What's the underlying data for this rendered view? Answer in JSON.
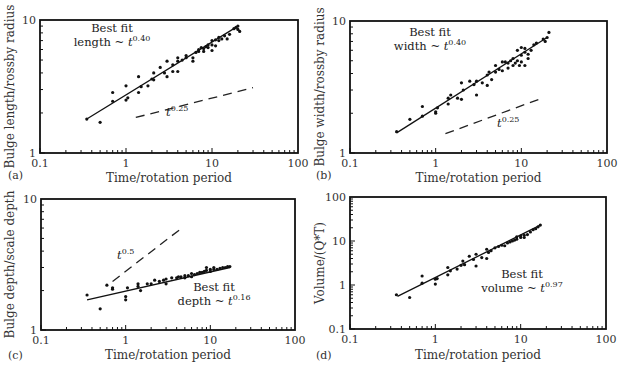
{
  "chart_data": [
    {
      "panel": "(a)",
      "type": "scatter",
      "xscale": "log",
      "yscale": "log",
      "xlabel": "Time/rotation period",
      "ylabel": "Bulge length/rossby radius",
      "xlim": [
        0.1,
        100
      ],
      "ylim": [
        1,
        10
      ],
      "xticks": [
        "0.1",
        "1",
        "10",
        "100"
      ],
      "yticks": [
        "1",
        "10"
      ],
      "annotation": {
        "line1": "Best fit",
        "line2": "length ~ ",
        "var": "t",
        "exp": "0.40"
      },
      "reference_annotation": {
        "var": "t",
        "exp": "0.25"
      },
      "fit": {
        "exponent": 0.4,
        "x": [
          0.35,
          20
        ],
        "y": [
          1.8,
          9.0
        ]
      },
      "reference_line": {
        "exponent": 0.25,
        "x": [
          1.3,
          30
        ],
        "y": [
          1.85,
          3.1
        ]
      },
      "points": [
        [
          0.35,
          1.8
        ],
        [
          0.5,
          1.7
        ],
        [
          0.7,
          2.45
        ],
        [
          0.7,
          2.85
        ],
        [
          1.0,
          2.5
        ],
        [
          1.0,
          3.2
        ],
        [
          1.05,
          2.6
        ],
        [
          1.4,
          2.85
        ],
        [
          1.4,
          3.75
        ],
        [
          1.5,
          3.15
        ],
        [
          1.8,
          3.2
        ],
        [
          2.0,
          3.6
        ],
        [
          2.1,
          3.55
        ],
        [
          2.1,
          4.0
        ],
        [
          2.5,
          4.4
        ],
        [
          2.8,
          4.0
        ],
        [
          3.0,
          3.75
        ],
        [
          3.0,
          4.9
        ],
        [
          3.5,
          4.1
        ],
        [
          3.5,
          4.6
        ],
        [
          4.0,
          4.9
        ],
        [
          4.0,
          4.1
        ],
        [
          4.0,
          5.2
        ],
        [
          4.5,
          5.0
        ],
        [
          5.0,
          5.2
        ],
        [
          5.0,
          5.4
        ],
        [
          6.0,
          5.2
        ],
        [
          6.0,
          4.9
        ],
        [
          6.5,
          5.7
        ],
        [
          7.0,
          5.8
        ],
        [
          7.0,
          6.0
        ],
        [
          7.5,
          6.2
        ],
        [
          8.0,
          5.8
        ],
        [
          8.0,
          6.1
        ],
        [
          8.5,
          6.3
        ],
        [
          9.0,
          6.2
        ],
        [
          9.0,
          6.5
        ],
        [
          10,
          6.5
        ],
        [
          10,
          5.9
        ],
        [
          10,
          7.0
        ],
        [
          11,
          6.4
        ],
        [
          11,
          7.1
        ],
        [
          12,
          7.0
        ],
        [
          12,
          7.4
        ],
        [
          13,
          7.2
        ],
        [
          14,
          7.6
        ],
        [
          15,
          7.2
        ],
        [
          16,
          7.8
        ],
        [
          18,
          8.6
        ],
        [
          19,
          8.8
        ],
        [
          20,
          9.0
        ],
        [
          20,
          8.5
        ],
        [
          21,
          8.2
        ]
      ]
    },
    {
      "panel": "(b)",
      "type": "scatter",
      "xscale": "log",
      "yscale": "log",
      "xlabel": "Time/rotation period",
      "ylabel": "Bulge width/rossby radius",
      "xlim": [
        0.1,
        100
      ],
      "ylim": [
        1,
        10
      ],
      "xticks": [
        "0.1",
        "1",
        "10",
        "100"
      ],
      "yticks": [
        "1",
        "10"
      ],
      "annotation": {
        "line1": "Best fit",
        "line2": "width ~ ",
        "var": "t",
        "exp": "0.40"
      },
      "reference_annotation": {
        "var": "t",
        "exp": "0.25"
      },
      "fit": {
        "exponent": 0.4,
        "x": [
          0.35,
          20
        ],
        "y": [
          1.42,
          7.5
        ]
      },
      "reference_line": {
        "exponent": 0.25,
        "x": [
          1.3,
          16
        ],
        "y": [
          1.4,
          2.55
        ]
      },
      "points": [
        [
          0.35,
          1.45
        ],
        [
          0.5,
          1.8
        ],
        [
          0.7,
          2.25
        ],
        [
          0.7,
          1.9
        ],
        [
          1.0,
          2.0
        ],
        [
          1.0,
          2.05
        ],
        [
          1.05,
          2.2
        ],
        [
          1.4,
          2.35
        ],
        [
          1.4,
          2.6
        ],
        [
          1.5,
          2.75
        ],
        [
          1.8,
          2.6
        ],
        [
          2.0,
          3.4
        ],
        [
          2.0,
          2.55
        ],
        [
          2.1,
          3.0
        ],
        [
          2.5,
          3.5
        ],
        [
          2.8,
          3.3
        ],
        [
          3.0,
          3.5
        ],
        [
          3.0,
          2.75
        ],
        [
          3.5,
          3.4
        ],
        [
          4.0,
          3.25
        ],
        [
          4.0,
          3.9
        ],
        [
          4.2,
          4.1
        ],
        [
          4.5,
          3.6
        ],
        [
          5.0,
          4.1
        ],
        [
          5.0,
          4.6
        ],
        [
          5.5,
          4.3
        ],
        [
          6.0,
          4.2
        ],
        [
          6.0,
          4.9
        ],
        [
          6.5,
          4.9
        ],
        [
          7.0,
          4.8
        ],
        [
          7.0,
          4.4
        ],
        [
          7.5,
          5.0
        ],
        [
          8.0,
          4.6
        ],
        [
          8.0,
          5.2
        ],
        [
          8.5,
          4.8
        ],
        [
          9.0,
          5.0
        ],
        [
          9.0,
          6.0
        ],
        [
          9.5,
          4.6
        ],
        [
          10,
          5.5
        ],
        [
          10,
          6.3
        ],
        [
          10,
          4.9
        ],
        [
          11,
          5.8
        ],
        [
          11,
          4.6
        ],
        [
          11,
          6.2
        ],
        [
          12,
          5.6
        ],
        [
          12,
          5.2
        ],
        [
          13,
          6.0
        ],
        [
          14,
          6.6
        ],
        [
          15,
          6.8
        ],
        [
          18,
          7.3
        ],
        [
          20,
          7.5
        ],
        [
          21,
          8.2
        ],
        [
          19,
          7.0
        ]
      ]
    },
    {
      "panel": "(c)",
      "type": "scatter",
      "xscale": "log",
      "yscale": "log",
      "xlabel": "Time/rotation period",
      "ylabel": "Bulge depth/scale depth",
      "xlim": [
        0.1,
        100
      ],
      "ylim": [
        1,
        10
      ],
      "xticks": [
        "0.1",
        "1",
        "10",
        "100"
      ],
      "yticks": [
        "1",
        "10"
      ],
      "annotation": {
        "line1": "Best fit",
        "line2": "depth ~ ",
        "var": "t",
        "exp": "0.16"
      },
      "reference_annotation": {
        "var": "t",
        "exp": "0.5"
      },
      "fit": {
        "exponent": 0.16,
        "x": [
          0.35,
          17
        ],
        "y": [
          1.7,
          3.0
        ]
      },
      "reference_line": {
        "exponent": 0.5,
        "x": [
          0.7,
          4.3
        ],
        "y": [
          2.35,
          5.8
        ]
      },
      "points": [
        [
          0.35,
          1.85
        ],
        [
          0.5,
          1.45
        ],
        [
          0.6,
          2.2
        ],
        [
          0.7,
          2.1
        ],
        [
          0.7,
          2.05
        ],
        [
          1.0,
          1.8
        ],
        [
          1.0,
          1.7
        ],
        [
          1.05,
          2.1
        ],
        [
          1.4,
          2.25
        ],
        [
          1.4,
          2.15
        ],
        [
          1.5,
          2.0
        ],
        [
          1.8,
          2.25
        ],
        [
          2.0,
          2.25
        ],
        [
          2.2,
          2.4
        ],
        [
          2.5,
          2.35
        ],
        [
          2.8,
          2.4
        ],
        [
          3.0,
          2.25
        ],
        [
          3.0,
          2.45
        ],
        [
          3.5,
          2.5
        ],
        [
          4.0,
          2.5
        ],
        [
          4.2,
          2.55
        ],
        [
          4.5,
          2.55
        ],
        [
          5.0,
          2.5
        ],
        [
          5.0,
          2.6
        ],
        [
          5.5,
          2.6
        ],
        [
          6.0,
          2.7
        ],
        [
          6.0,
          2.55
        ],
        [
          6.5,
          2.65
        ],
        [
          7.0,
          2.7
        ],
        [
          7.5,
          2.75
        ],
        [
          8.0,
          2.75
        ],
        [
          8.5,
          2.8
        ],
        [
          9.0,
          2.85
        ],
        [
          9.0,
          3.0
        ],
        [
          10,
          2.9
        ],
        [
          10,
          2.8
        ],
        [
          11,
          2.9
        ],
        [
          11,
          3.0
        ],
        [
          12,
          2.9
        ],
        [
          13,
          2.95
        ],
        [
          14,
          3.0
        ],
        [
          15,
          3.0
        ],
        [
          16,
          3.05
        ],
        [
          17,
          3.05
        ]
      ]
    },
    {
      "panel": "(d)",
      "type": "scatter",
      "xscale": "log",
      "yscale": "log",
      "xlabel": "Time/rotation period",
      "ylabel": "Volume/(Q*T)",
      "xlim": [
        0.1,
        100
      ],
      "ylim": [
        0.1,
        100
      ],
      "xticks": [
        "0.1",
        "1",
        "10",
        "100"
      ],
      "yticks": [
        "0.1",
        "1",
        "10",
        "100"
      ],
      "annotation": {
        "line1": "Best fit",
        "line2": "volume ~ ",
        "var": "t",
        "exp": "0.97"
      },
      "fit": {
        "exponent": 0.97,
        "x": [
          0.36,
          17
        ],
        "y": [
          0.55,
          23
        ]
      },
      "points": [
        [
          0.35,
          0.6
        ],
        [
          0.5,
          0.52
        ],
        [
          0.7,
          1.6
        ],
        [
          0.7,
          1.1
        ],
        [
          1.0,
          1.05
        ],
        [
          1.0,
          1.35
        ],
        [
          1.05,
          1.4
        ],
        [
          1.4,
          1.7
        ],
        [
          1.4,
          2.5
        ],
        [
          1.5,
          2.1
        ],
        [
          1.8,
          2.3
        ],
        [
          2.0,
          2.8
        ],
        [
          2.1,
          3.5
        ],
        [
          2.2,
          2.9
        ],
        [
          2.5,
          4.5
        ],
        [
          2.8,
          3.8
        ],
        [
          3.0,
          2.7
        ],
        [
          3.0,
          5.0
        ],
        [
          3.5,
          4.2
        ],
        [
          4.0,
          4.0
        ],
        [
          4.0,
          6.5
        ],
        [
          4.2,
          5.5
        ],
        [
          4.5,
          6.0
        ],
        [
          5.0,
          7.0
        ],
        [
          5.5,
          7.5
        ],
        [
          6.0,
          8.0
        ],
        [
          6.5,
          7.8
        ],
        [
          7.0,
          9.0
        ],
        [
          7.5,
          9.5
        ],
        [
          8.0,
          10
        ],
        [
          8.5,
          10.5
        ],
        [
          9.0,
          11
        ],
        [
          9.0,
          12.5
        ],
        [
          10,
          12
        ],
        [
          10,
          13
        ],
        [
          11,
          13.5
        ],
        [
          11,
          12
        ],
        [
          12,
          14
        ],
        [
          13,
          16
        ],
        [
          14,
          18
        ],
        [
          15,
          19
        ],
        [
          16,
          21
        ],
        [
          17,
          23
        ]
      ]
    }
  ]
}
